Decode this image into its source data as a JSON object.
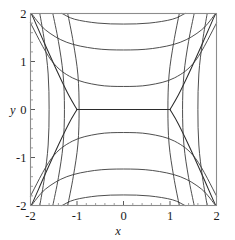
{
  "figure": {
    "background_color": "#ffffff",
    "frame_color": "#8c8c8c",
    "contour_color": "#3a3a3a",
    "width": 235,
    "height": 240
  },
  "chart_data": {
    "type": "line",
    "subtype": "contour",
    "title": "",
    "xlabel": "x",
    "ylabel": "y",
    "xlim": [
      -2,
      2
    ],
    "ylim": [
      -2,
      2
    ],
    "grid": false,
    "legend": null,
    "xticks": [
      -2,
      -1,
      0,
      1,
      2
    ],
    "yticks": [
      -2,
      -1,
      0,
      1,
      2
    ],
    "xticklabels": [
      "-2",
      "-1",
      "0",
      "1",
      "2"
    ],
    "yticklabels": [
      "-2",
      "-1",
      "0",
      "1",
      "2"
    ],
    "minor_tick_step": 0.2,
    "saddle_points": [
      [
        -1,
        0
      ],
      [
        1,
        0
      ]
    ],
    "separatrix_segment": {
      "from": [
        -1,
        0
      ],
      "to": [
        1,
        0
      ]
    },
    "levels": [
      -3,
      -2,
      -1,
      0,
      1,
      2,
      3
    ],
    "series": [
      {
        "name": "separatrix-level-0",
        "level": 0,
        "points": [
          [
            -1,
            0
          ],
          [
            1,
            0
          ]
        ]
      },
      {
        "name": "separatrix-fork-upper-left",
        "level": 0,
        "points": [
          [
            -1,
            0
          ],
          [
            -1.18,
            0.3
          ],
          [
            -1.42,
            0.78
          ],
          [
            -1.7,
            1.38
          ],
          [
            -1.95,
            1.93
          ],
          [
            -2,
            2.0
          ]
        ]
      },
      {
        "name": "separatrix-fork-lower-left",
        "level": 0,
        "points": [
          [
            -1,
            0
          ],
          [
            -1.18,
            -0.3
          ],
          [
            -1.42,
            -0.78
          ],
          [
            -1.7,
            -1.38
          ],
          [
            -1.95,
            -1.93
          ],
          [
            -2,
            -2.0
          ]
        ]
      },
      {
        "name": "separatrix-fork-upper-right",
        "level": 0,
        "points": [
          [
            1,
            0
          ],
          [
            1.18,
            0.3
          ],
          [
            1.42,
            0.78
          ],
          [
            1.7,
            1.38
          ],
          [
            1.95,
            1.93
          ],
          [
            2,
            2.0
          ]
        ]
      },
      {
        "name": "separatrix-fork-lower-right",
        "level": 0,
        "points": [
          [
            1,
            0
          ],
          [
            1.18,
            -0.3
          ],
          [
            1.42,
            -0.78
          ],
          [
            1.7,
            -1.38
          ],
          [
            1.95,
            -1.93
          ],
          [
            2,
            -2.0
          ]
        ]
      },
      {
        "name": "upper-branch-inner",
        "level": 1,
        "points": [
          [
            -2,
            1.8
          ],
          [
            -1.55,
            1.02
          ],
          [
            -1.1,
            0.66
          ],
          [
            -0.55,
            0.51
          ],
          [
            0.0,
            0.48
          ],
          [
            0.55,
            0.51
          ],
          [
            1.1,
            0.66
          ],
          [
            1.55,
            1.02
          ],
          [
            2,
            1.8
          ]
        ]
      },
      {
        "name": "upper-branch-middle",
        "level": 2,
        "points": [
          [
            -1.98,
            2.0
          ],
          [
            -1.68,
            1.66
          ],
          [
            -1.22,
            1.4
          ],
          [
            -0.62,
            1.27
          ],
          [
            0.0,
            1.24
          ],
          [
            0.62,
            1.27
          ],
          [
            1.22,
            1.4
          ],
          [
            1.68,
            1.66
          ],
          [
            1.98,
            2.0
          ]
        ]
      },
      {
        "name": "upper-branch-outer",
        "level": 3,
        "points": [
          [
            -1.32,
            2.0
          ],
          [
            -1.05,
            1.88
          ],
          [
            -0.55,
            1.8
          ],
          [
            0.0,
            1.78
          ],
          [
            0.55,
            1.8
          ],
          [
            1.05,
            1.88
          ],
          [
            1.32,
            2.0
          ]
        ]
      },
      {
        "name": "lower-branch-inner",
        "level": -1,
        "points": [
          [
            -2,
            -1.8
          ],
          [
            -1.55,
            -1.02
          ],
          [
            -1.1,
            -0.66
          ],
          [
            -0.55,
            -0.51
          ],
          [
            0.0,
            -0.48
          ],
          [
            0.55,
            -0.51
          ],
          [
            1.1,
            -0.66
          ],
          [
            1.55,
            -1.02
          ],
          [
            2,
            -1.8
          ]
        ]
      },
      {
        "name": "lower-branch-middle",
        "level": -2,
        "points": [
          [
            -1.98,
            -2.0
          ],
          [
            -1.68,
            -1.66
          ],
          [
            -1.22,
            -1.4
          ],
          [
            -0.62,
            -1.27
          ],
          [
            0.0,
            -1.24
          ],
          [
            0.62,
            -1.27
          ],
          [
            1.22,
            -1.4
          ],
          [
            1.68,
            -1.66
          ],
          [
            1.98,
            -2.0
          ]
        ]
      },
      {
        "name": "lower-branch-outer",
        "level": -3,
        "points": [
          [
            -1.32,
            -2.0
          ],
          [
            -1.05,
            -1.88
          ],
          [
            -0.55,
            -1.8
          ],
          [
            0.0,
            -1.78
          ],
          [
            0.55,
            -1.8
          ],
          [
            1.05,
            -1.88
          ],
          [
            1.32,
            -2.0
          ]
        ]
      },
      {
        "name": "left-branch-inner",
        "level": 1,
        "points": [
          [
            -1.2,
            2.0
          ],
          [
            -1.08,
            1.4
          ],
          [
            -0.98,
            0.72
          ],
          [
            -0.955,
            0.0
          ],
          [
            -0.98,
            -0.72
          ],
          [
            -1.08,
            -1.4
          ],
          [
            -1.2,
            -2.0
          ]
        ]
      },
      {
        "name": "left-branch-middle",
        "level": 2,
        "points": [
          [
            -1.52,
            2.0
          ],
          [
            -1.4,
            1.42
          ],
          [
            -1.3,
            0.74
          ],
          [
            -1.27,
            0.0
          ],
          [
            -1.3,
            -0.74
          ],
          [
            -1.4,
            -1.42
          ],
          [
            -1.52,
            -2.0
          ]
        ]
      },
      {
        "name": "left-branch-outer",
        "level": 3,
        "points": [
          [
            -1.8,
            2.0
          ],
          [
            -1.7,
            1.42
          ],
          [
            -1.62,
            0.74
          ],
          [
            -1.6,
            0.0
          ],
          [
            -1.62,
            -0.74
          ],
          [
            -1.7,
            -1.42
          ],
          [
            -1.8,
            -2.0
          ]
        ]
      },
      {
        "name": "right-branch-inner",
        "level": 1,
        "points": [
          [
            1.2,
            2.0
          ],
          [
            1.08,
            1.4
          ],
          [
            0.98,
            0.72
          ],
          [
            0.955,
            0.0
          ],
          [
            0.98,
            -0.72
          ],
          [
            1.08,
            -1.4
          ],
          [
            1.2,
            -2.0
          ]
        ]
      },
      {
        "name": "right-branch-middle",
        "level": 2,
        "points": [
          [
            1.52,
            2.0
          ],
          [
            1.4,
            1.42
          ],
          [
            1.3,
            0.74
          ],
          [
            1.27,
            0.0
          ],
          [
            1.3,
            -0.74
          ],
          [
            1.4,
            -1.42
          ],
          [
            1.52,
            -2.0
          ]
        ]
      },
      {
        "name": "right-branch-outer",
        "level": 3,
        "points": [
          [
            1.8,
            2.0
          ],
          [
            1.7,
            1.42
          ],
          [
            1.62,
            0.74
          ],
          [
            1.6,
            0.0
          ],
          [
            1.62,
            -0.74
          ],
          [
            1.7,
            -1.42
          ],
          [
            1.8,
            -2.0
          ]
        ]
      }
    ]
  },
  "axes": {
    "x_title": "x",
    "y_title": "y"
  }
}
